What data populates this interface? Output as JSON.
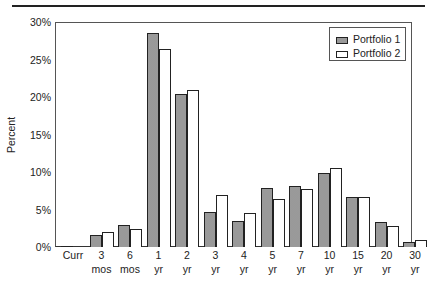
{
  "chart_data": {
    "type": "bar",
    "title": "",
    "xlabel": "",
    "ylabel": "Percent",
    "ylim": [
      0,
      30
    ],
    "yticks": [
      "0%",
      "5%",
      "10%",
      "15%",
      "20%",
      "25%",
      "30%"
    ],
    "grid": false,
    "legend_position": "top-right",
    "categories": [
      "Curr",
      "3 mos",
      "6 mos",
      "1 yr",
      "2 yr",
      "3 yr",
      "4 yr",
      "5 yr",
      "7 yr",
      "10 yr",
      "15 yr",
      "20 yr",
      "30 yr"
    ],
    "category_lines": [
      [
        "Curr",
        ""
      ],
      [
        "3",
        "mos"
      ],
      [
        "6",
        "mos"
      ],
      [
        "1",
        "yr"
      ],
      [
        "2",
        "yr"
      ],
      [
        "3",
        "yr"
      ],
      [
        "4",
        "yr"
      ],
      [
        "5",
        "yr"
      ],
      [
        "7",
        "yr"
      ],
      [
        "10",
        "yr"
      ],
      [
        "15",
        "yr"
      ],
      [
        "20",
        "yr"
      ],
      [
        "30",
        "yr"
      ]
    ],
    "series": [
      {
        "name": "Portfolio 1",
        "pattern": "crosshatch",
        "values": [
          0.1,
          1.6,
          2.9,
          28.5,
          20.4,
          4.7,
          3.5,
          7.9,
          8.1,
          9.9,
          6.7,
          3.3,
          0.7
        ]
      },
      {
        "name": "Portfolio 2",
        "pattern": "hollow",
        "values": [
          0.0,
          2.0,
          2.4,
          26.4,
          20.9,
          7.0,
          4.6,
          6.4,
          7.7,
          10.5,
          6.7,
          2.8,
          0.9
        ]
      }
    ]
  },
  "legend": {
    "items": [
      "Portfolio 1",
      "Portfolio 2"
    ]
  },
  "axis": {
    "ylabel": "Percent"
  }
}
